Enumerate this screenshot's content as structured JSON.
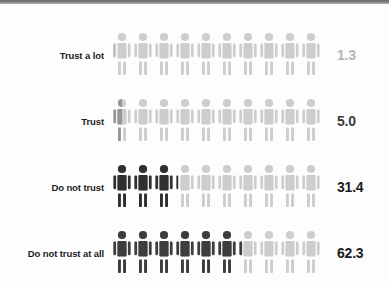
{
  "chart_data": {
    "type": "bar",
    "subtype": "pictogram-isotype",
    "title": "",
    "subtitle": "",
    "xlabel": "",
    "ylabel": "",
    "units": "percent",
    "icons_per_row": 10,
    "value_per_icon": 10,
    "categories": [
      "Trust a lot",
      "Trust",
      "Do not trust",
      "Do not trust at all"
    ],
    "values": [
      1.3,
      5.0,
      31.4,
      62.3
    ],
    "value_labels": [
      "1.3",
      "5.0",
      "31.4",
      "62.3"
    ],
    "series": [
      {
        "name": "Share of respondents",
        "values": [
          1.3,
          5.0,
          31.4,
          62.3
        ]
      }
    ],
    "legend": [],
    "grid": false,
    "ylim": [
      0,
      100
    ],
    "colors": {
      "filled_row_0": "#b9b9b9",
      "filled_row_1": "#8f8f8f",
      "filled_row_2": "#333333",
      "filled_row_3": "#3d3d3d",
      "empty": "#cccccc",
      "label_text": "#1d1d1d",
      "background": "#fdfdfd",
      "top_rule": "#6e6e6e"
    }
  },
  "rows": [
    {
      "label": "Trust a lot",
      "value_label": "1.3",
      "value": 1.3,
      "fill_color": "#b8b8b8",
      "empty_color": "#cdcdcd",
      "value_color": "#b5b5b5"
    },
    {
      "label": "Trust",
      "value_label": "5.0",
      "value": 5.0,
      "fill_color": "#969696",
      "empty_color": "#cdcdcd",
      "value_color": "#3c3c3c"
    },
    {
      "label": "Do not trust",
      "value_label": "31.4",
      "value": 31.4,
      "fill_color": "#2f2f2f",
      "empty_color": "#cdcdcd",
      "value_color": "#1d1d1d"
    },
    {
      "label": "Do not trust at all",
      "value_label": "62.3",
      "value": 62.3,
      "fill_color": "#3d3d3d",
      "empty_color": "#cdcdcd",
      "value_color": "#1d1d1d"
    }
  ],
  "icon": {
    "name": "person-icon",
    "count_per_row": 10
  }
}
